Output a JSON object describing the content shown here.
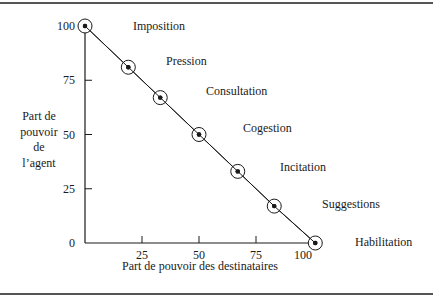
{
  "chart_data": {
    "type": "line",
    "title": "",
    "xlabel": "Part de pouvoir des destinataires",
    "ylabel": "Part de pouvoir de l’agent",
    "ylabel_lines": [
      "Part de",
      "pouvoir",
      "de",
      "l’agent"
    ],
    "xlim": [
      0,
      100
    ],
    "ylim": [
      0,
      100
    ],
    "x_ticks": [
      25,
      50,
      75,
      100
    ],
    "y_ticks": [
      0,
      25,
      50,
      75,
      100
    ],
    "grid": false,
    "legend": null,
    "series": [
      {
        "name": "Continuum du pouvoir",
        "points": [
          {
            "x": 0,
            "y": 100,
            "label": "Imposition"
          },
          {
            "x": 19,
            "y": 81,
            "label": "Pression"
          },
          {
            "x": 33,
            "y": 67,
            "label": "Consultation"
          },
          {
            "x": 50,
            "y": 50,
            "label": "Cogestion"
          },
          {
            "x": 67,
            "y": 33,
            "label": "Incitation"
          },
          {
            "x": 83,
            "y": 17,
            "label": "Suggestions"
          },
          {
            "x": 101,
            "y": 0,
            "label": "Habilitation"
          }
        ]
      }
    ],
    "annotations": [
      "Imposition",
      "Pression",
      "Consultation",
      "Cogestion",
      "Incitation",
      "Suggestions",
      "Habilitation"
    ]
  },
  "colors": {
    "ink": "#1a1a1a",
    "rule": "#555555",
    "background": "#ffffff"
  }
}
